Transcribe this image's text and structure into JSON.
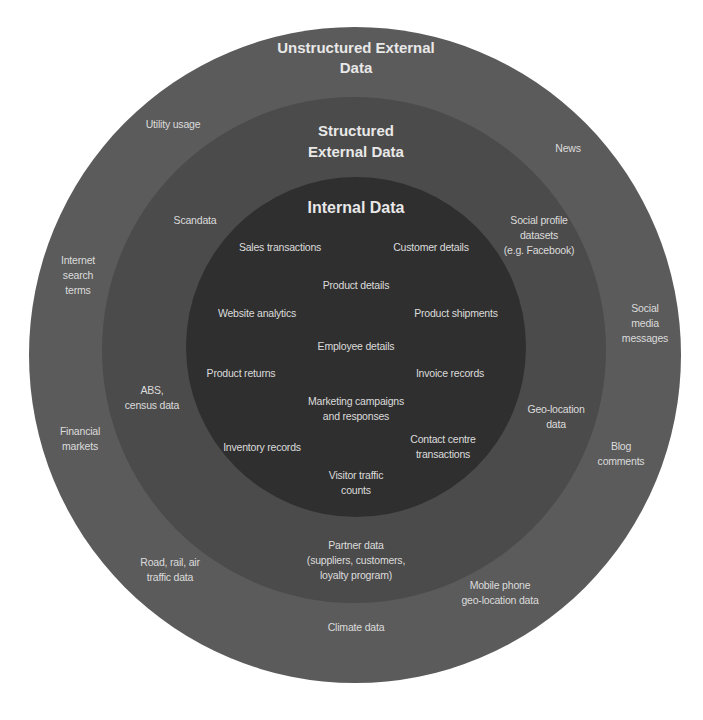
{
  "diagram": {
    "type": "concentric-circles",
    "colors": {
      "outer_ring": "#5b5b5b",
      "middle_ring": "#4b4b4b",
      "inner_circle": "#2f2f2f",
      "text": "#dcdcdc",
      "background": "#ffffff"
    },
    "outer": {
      "title": "Unstructured External\nData",
      "items": [
        "Utility usage",
        "News",
        "Internet\nsearch\nterms",
        "Social\nmedia\nmessages",
        "Financial\nmarkets",
        "Blog\ncomments",
        "Road, rail, air\ntraffic data",
        "Mobile phone\ngeo-location data",
        "Climate data"
      ]
    },
    "middle": {
      "title": "Structured\nExternal Data",
      "items": [
        "Scandata",
        "Social profile\ndatasets\n(e.g. Facebook)",
        "ABS,\ncensus data",
        "Geo-location\ndata",
        "Partner data\n(suppliers, customers,\nloyalty program)"
      ]
    },
    "inner": {
      "title": "Internal Data",
      "items": [
        "Sales transactions",
        "Customer details",
        "Product details",
        "Website analytics",
        "Product shipments",
        "Employee details",
        "Product returns",
        "Invoice records",
        "Marketing campaigns\nand responses",
        "Inventory records",
        "Contact centre\ntransactions",
        "Visitor traffic\ncounts"
      ]
    }
  }
}
